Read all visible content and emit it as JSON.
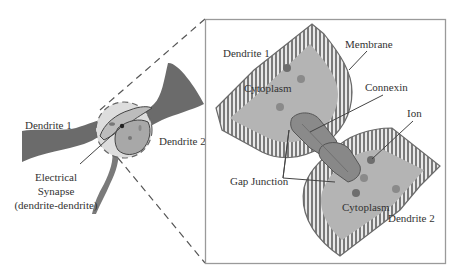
{
  "figure": {
    "overview": {
      "labels": {
        "dendrite_1": "Dendrite 1",
        "dendrite_2": "Dendrite 2",
        "synapse_line1": "Electrical",
        "synapse_line2": "Synapse",
        "synapse_line3": "(dendrite-dendrite)"
      }
    },
    "inset": {
      "labels": {
        "dendrite_1": "Dendrite 1",
        "dendrite_2": "Dendrite 2",
        "cytoplasm_top": "Cytoplasm",
        "cytoplasm_bottom": "Cytoplasm",
        "membrane": "Membrane",
        "connexin": "Connexin",
        "ion": "Ion",
        "gap_junction": "Gap Junction"
      }
    },
    "colors": {
      "dendrite_fill": "#6b6b6b",
      "cytoplasm": "#b4b4b4",
      "membrane_head": "#7a7a7a",
      "membrane_tail": "#e6e6e6",
      "ion": "#777777",
      "connexin": "#8a8a8a",
      "inset_border": "#9a9a9a",
      "dashed_line": "#555555",
      "text": "#333333"
    }
  }
}
